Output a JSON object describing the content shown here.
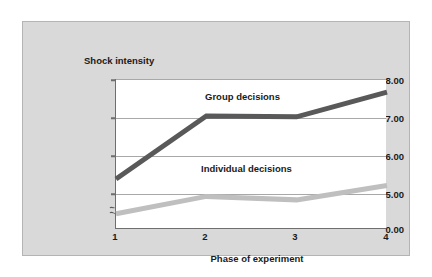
{
  "chart_data": {
    "type": "line",
    "title": "",
    "xlabel": "Phase of experiment",
    "ylabel": "Shock intensity",
    "x": [
      1,
      2,
      3,
      4
    ],
    "xtick_labels": [
      "1",
      "2",
      "3",
      "4"
    ],
    "ytick_labels": [
      "8.00",
      "7.00",
      "6.00",
      "5.00",
      "0.00"
    ],
    "ytick_values": [
      8.0,
      7.0,
      6.0,
      5.0,
      0.0
    ],
    "ylim": [
      4.55,
      8.0
    ],
    "y_axis_break": true,
    "y_axis_break_note": "axis broken between 0.00 and 5.00",
    "grid": "horizontal",
    "legend_position": "inline-labels",
    "series": [
      {
        "name": "Group decisions",
        "color": "#595959",
        "values": [
          5.7,
          7.15,
          7.13,
          7.7
        ]
      },
      {
        "name": "Individual decisions",
        "color": "#bfbfbf",
        "values": [
          4.9,
          5.3,
          5.22,
          5.55
        ]
      }
    ],
    "annotations": [
      {
        "text": "Group decisions"
      },
      {
        "text": "Individual decisions"
      }
    ]
  },
  "axes": {
    "y_title": "Shock intensity",
    "x_title": "Phase of experiment",
    "yticks": [
      {
        "label": "8.00",
        "value": 8.0
      },
      {
        "label": "7.00",
        "value": 7.0
      },
      {
        "label": "6.00",
        "value": 6.0
      },
      {
        "label": "5.00",
        "value": 5.0
      },
      {
        "label": "0.00",
        "value": 0.0
      }
    ],
    "xticks": [
      {
        "label": "1",
        "value": 1
      },
      {
        "label": "2",
        "value": 2
      },
      {
        "label": "3",
        "value": 3
      },
      {
        "label": "4",
        "value": 4
      }
    ]
  },
  "colors": {
    "card_background": "#d9d9d9",
    "plot_background": "#ffffff",
    "axis": "#6e6e6e",
    "gridline": "#a8a8a8",
    "group_line": "#595959",
    "individual_line": "#bfbfbf",
    "text": "#1a1a1a"
  }
}
